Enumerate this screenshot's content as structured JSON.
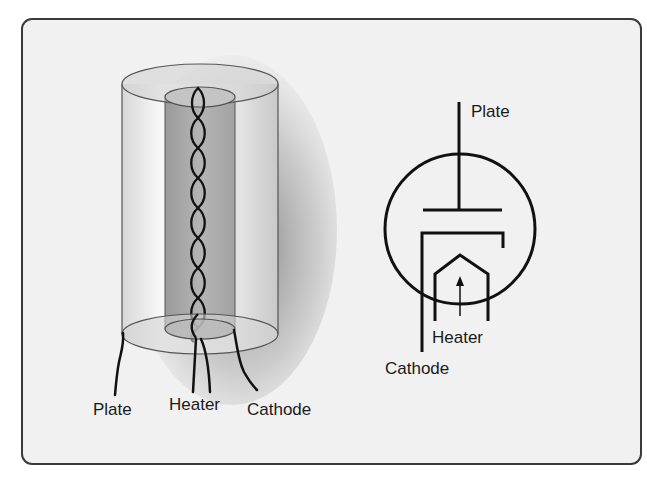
{
  "figure": {
    "type": "vacuum tube diode illustration",
    "left_diagram": {
      "title": "cutaway-3d",
      "labels": {
        "plate": "Plate",
        "heater": "Heater",
        "cathode": "Cathode"
      }
    },
    "right_diagram": {
      "title": "schematic-symbol",
      "labels": {
        "plate": "Plate",
        "heater": "Heater",
        "cathode": "Cathode"
      }
    }
  },
  "colors": {
    "panel_bg": "#f1f1f1",
    "border": "#3a3a3a",
    "stroke": "#111111"
  }
}
